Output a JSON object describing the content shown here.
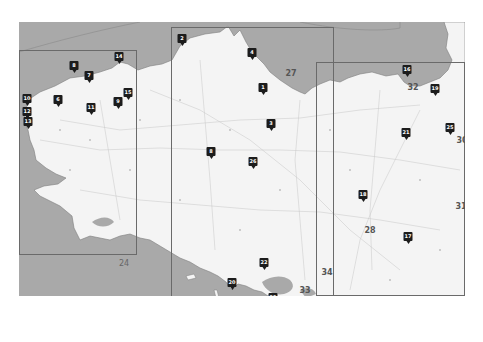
{
  "map": {
    "colors": {
      "sea": "#a9a9a9",
      "land": "#f4f4f4",
      "marker": "#1c1c1c",
      "frame": "#6a6a6a",
      "background": "#ffffff"
    },
    "sheet_labels": [
      {
        "text": "27",
        "x": 291,
        "y": 73
      },
      {
        "text": "32",
        "x": 413,
        "y": 87
      },
      {
        "text": "30",
        "x": 462,
        "y": 140
      },
      {
        "text": "31",
        "x": 461,
        "y": 206
      },
      {
        "text": "28",
        "x": 370,
        "y": 230
      },
      {
        "text": "34",
        "x": 327,
        "y": 272
      },
      {
        "text": "33",
        "x": 305,
        "y": 290
      },
      {
        "text": "24",
        "x": 124,
        "y": 263
      }
    ],
    "markers": [
      {
        "label": "1",
        "x": 263,
        "y": 92
      },
      {
        "label": "2",
        "x": 182,
        "y": 43
      },
      {
        "label": "3",
        "x": 271,
        "y": 128
      },
      {
        "label": "4",
        "x": 252,
        "y": 57
      },
      {
        "label": "6",
        "x": 58,
        "y": 104
      },
      {
        "label": "7",
        "x": 89,
        "y": 80
      },
      {
        "label": "8",
        "x": 74,
        "y": 70
      },
      {
        "label": "9",
        "x": 118,
        "y": 106
      },
      {
        "label": "10",
        "x": 27,
        "y": 103
      },
      {
        "label": "11",
        "x": 91,
        "y": 112
      },
      {
        "label": "12",
        "x": 27,
        "y": 116
      },
      {
        "label": "13",
        "x": 28,
        "y": 126
      },
      {
        "label": "14",
        "x": 119,
        "y": 61
      },
      {
        "label": "15",
        "x": 128,
        "y": 97
      },
      {
        "label": "16",
        "x": 407,
        "y": 74
      },
      {
        "label": "17",
        "x": 408,
        "y": 241
      },
      {
        "label": "18",
        "x": 363,
        "y": 199
      },
      {
        "label": "19",
        "x": 435,
        "y": 93
      },
      {
        "label": "20",
        "x": 232,
        "y": 287
      },
      {
        "label": "21",
        "x": 406,
        "y": 137
      },
      {
        "label": "22",
        "x": 264,
        "y": 267
      },
      {
        "label": "23",
        "x": 273,
        "y": 302
      },
      {
        "label": "24",
        "x": 324,
        "y": 306
      },
      {
        "label": "25",
        "x": 450,
        "y": 132
      },
      {
        "label": "26",
        "x": 253,
        "y": 166
      },
      {
        "label": "8b",
        "x": 211,
        "y": 156
      }
    ],
    "sheet_frames": [
      {
        "name": "sheet-west",
        "x": 19,
        "y": 50,
        "w": 118,
        "h": 205
      },
      {
        "name": "sheet-center",
        "x": 171,
        "y": 27,
        "w": 163,
        "h": 290
      },
      {
        "name": "sheet-east",
        "x": 316,
        "y": 62,
        "w": 149,
        "h": 234
      }
    ]
  }
}
